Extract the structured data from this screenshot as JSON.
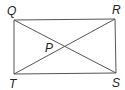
{
  "diagram": {
    "type": "rectangle-with-diagonals",
    "vertices": {
      "Q": {
        "label": "Q",
        "x": 14,
        "y": 20
      },
      "R": {
        "label": "R",
        "x": 115,
        "y": 19
      },
      "S": {
        "label": "S",
        "x": 116,
        "y": 73
      },
      "T": {
        "label": "T",
        "x": 14,
        "y": 74
      }
    },
    "intersection": {
      "label": "P"
    },
    "line_color": "#555555",
    "background": "#ffffff"
  }
}
